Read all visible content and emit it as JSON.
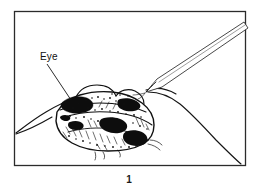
{
  "figure": {
    "caption": "1",
    "kind": "line-art anatomical dissection illustration",
    "background_color": "#ffffff",
    "ink_color": "#111111",
    "frame": {
      "border_color": "#2b2b2b",
      "x": 14,
      "y": 11,
      "width": 232,
      "height": 155
    },
    "annotations": [
      {
        "id": "eye",
        "label": "Eye",
        "label_x": 40,
        "label_y": 60,
        "leader_from_x": 47,
        "leader_from_y": 64,
        "leader_to_x": 71,
        "leader_to_y": 100
      }
    ],
    "instrument": {
      "name": "probe-needle",
      "tip_x": 145,
      "tip_y": 92,
      "entry_edge": "top-right"
    },
    "subject": {
      "name": "dissected-specimen-cross-section",
      "center_x": 112,
      "center_y": 115
    }
  }
}
